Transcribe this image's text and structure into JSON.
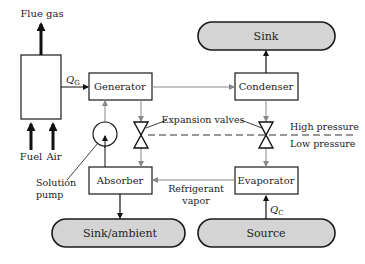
{
  "diagram": {
    "labels": {
      "flue_gas": "Flue gas",
      "fuel": "Fuel",
      "air": "Air",
      "qg_main": "Q",
      "qg_sub": "G",
      "qc_main": "Q",
      "qc_sub": "C",
      "generator": "Generator",
      "condenser": "Condenser",
      "absorber": "Absorber",
      "evaporator": "Evaporator",
      "sink": "Sink",
      "sink_ambient": "Sink/ambient",
      "source": "Source",
      "expansion_valves": "Expansion valves",
      "high_pressure": "High pressure",
      "low_pressure": "Low pressure",
      "solution_pump_line1": "Solution",
      "solution_pump_line2": "pump",
      "refrigerant_line1": "Refrigerant",
      "refrigerant_line2": "vapor"
    },
    "colors": {
      "reservoir_fill": "#d4d4d4",
      "stroke": "#1a1a1a",
      "flow_line": "#888888"
    }
  }
}
